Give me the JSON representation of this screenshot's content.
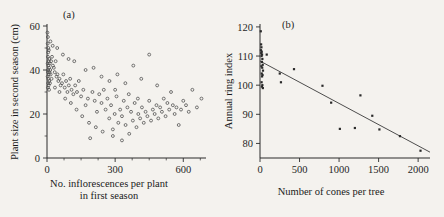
{
  "figure": {
    "background": "#f4f2ee",
    "ink": "#1f1f1f"
  },
  "chart_data": [
    {
      "type": "scatter",
      "panel_label": "(a)",
      "title": "",
      "xlabel_line1": "No. inflorescences per plant",
      "xlabel_line2": "in first season",
      "ylabel": "Plant size in second season (cm)",
      "xlim": [
        0,
        700
      ],
      "ylim": [
        0,
        60
      ],
      "xticks": [
        0,
        300,
        600
      ],
      "xticklabels": [
        "0",
        "300",
        "600"
      ],
      "xminorticks": [
        75,
        150,
        225,
        375,
        450,
        525,
        675
      ],
      "yticks": [
        0,
        20,
        40,
        60
      ],
      "yticklabels": [
        "0",
        "20",
        "40",
        "60"
      ],
      "yminorticks": [
        10,
        30,
        50
      ],
      "grid": false,
      "legend": "none",
      "marker": "open-circle",
      "points": [
        [
          2,
          57
        ],
        [
          4,
          55
        ],
        [
          3,
          52
        ],
        [
          6,
          50
        ],
        [
          5,
          48
        ],
        [
          8,
          49
        ],
        [
          4,
          46
        ],
        [
          10,
          45
        ],
        [
          7,
          44
        ],
        [
          3,
          43
        ],
        [
          12,
          43
        ],
        [
          6,
          42
        ],
        [
          9,
          41
        ],
        [
          5,
          40
        ],
        [
          14,
          40
        ],
        [
          4,
          39
        ],
        [
          11,
          39
        ],
        [
          8,
          38
        ],
        [
          3,
          37
        ],
        [
          16,
          38
        ],
        [
          6,
          36
        ],
        [
          10,
          35
        ],
        [
          5,
          34
        ],
        [
          13,
          34
        ],
        [
          7,
          33
        ],
        [
          4,
          32
        ],
        [
          9,
          31
        ],
        [
          18,
          44
        ],
        [
          22,
          46
        ],
        [
          26,
          42
        ],
        [
          30,
          41
        ],
        [
          34,
          39
        ],
        [
          38,
          44
        ],
        [
          42,
          37
        ],
        [
          46,
          38
        ],
        [
          50,
          35
        ],
        [
          55,
          36
        ],
        [
          60,
          33
        ],
        [
          66,
          34
        ],
        [
          72,
          38
        ],
        [
          78,
          32
        ],
        [
          84,
          35
        ],
        [
          90,
          30
        ],
        [
          96,
          33
        ],
        [
          102,
          36
        ],
        [
          108,
          31
        ],
        [
          116,
          29
        ],
        [
          124,
          33
        ],
        [
          132,
          30
        ],
        [
          140,
          35
        ],
        [
          150,
          28
        ],
        [
          160,
          31
        ],
        [
          170,
          24
        ],
        [
          180,
          27
        ],
        [
          190,
          9
        ],
        [
          200,
          30
        ],
        [
          210,
          26
        ],
        [
          220,
          21
        ],
        [
          230,
          29
        ],
        [
          240,
          25
        ],
        [
          250,
          31
        ],
        [
          258,
          22
        ],
        [
          266,
          27
        ],
        [
          274,
          18
        ],
        [
          282,
          24
        ],
        [
          290,
          13
        ],
        [
          298,
          20
        ],
        [
          306,
          28
        ],
        [
          314,
          16
        ],
        [
          322,
          22
        ],
        [
          330,
          19
        ],
        [
          338,
          26
        ],
        [
          346,
          15
        ],
        [
          354,
          23
        ],
        [
          362,
          11
        ],
        [
          370,
          21
        ],
        [
          378,
          17
        ],
        [
          386,
          25
        ],
        [
          394,
          14
        ],
        [
          402,
          20
        ],
        [
          410,
          18
        ],
        [
          418,
          23
        ],
        [
          426,
          16
        ],
        [
          434,
          21
        ],
        [
          442,
          19
        ],
        [
          450,
          26
        ],
        [
          458,
          17
        ],
        [
          466,
          22
        ],
        [
          474,
          20
        ],
        [
          482,
          24
        ],
        [
          490,
          18
        ],
        [
          498,
          23
        ],
        [
          506,
          21
        ],
        [
          514,
          27
        ],
        [
          522,
          19
        ],
        [
          530,
          25
        ],
        [
          538,
          22
        ],
        [
          546,
          30
        ],
        [
          554,
          24
        ],
        [
          562,
          20
        ],
        [
          570,
          23
        ],
        [
          580,
          15
        ],
        [
          590,
          22
        ],
        [
          600,
          26
        ],
        [
          612,
          24
        ],
        [
          624,
          21
        ],
        [
          640,
          31
        ],
        [
          660,
          23
        ],
        [
          680,
          27
        ],
        [
          170,
          40
        ],
        [
          205,
          41
        ],
        [
          240,
          37
        ],
        [
          275,
          35
        ],
        [
          310,
          38
        ],
        [
          345,
          34
        ],
        [
          380,
          42
        ],
        [
          415,
          36
        ],
        [
          450,
          47
        ],
        [
          485,
          33
        ],
        [
          120,
          44
        ],
        [
          95,
          45
        ],
        [
          70,
          47
        ],
        [
          45,
          50
        ],
        [
          25,
          51
        ],
        [
          15,
          53
        ],
        [
          20,
          36
        ],
        [
          35,
          32
        ],
        [
          55,
          30
        ],
        [
          80,
          27
        ],
        [
          105,
          25
        ],
        [
          130,
          22
        ],
        [
          155,
          19
        ],
        [
          185,
          16
        ],
        [
          215,
          14
        ],
        [
          245,
          12
        ],
        [
          290,
          10
        ],
        [
          330,
          8
        ],
        [
          300,
          31
        ],
        [
          360,
          29
        ],
        [
          400,
          27
        ]
      ]
    },
    {
      "type": "scatter",
      "panel_label": "(b)",
      "title": "",
      "xlabel": "Number of cones per tree",
      "ylabel": "Annual ring index",
      "xlim": [
        0,
        2150
      ],
      "ylim": [
        75,
        121
      ],
      "xticks": [
        0,
        500,
        1000,
        1500,
        2000
      ],
      "xticklabels": [
        "0",
        "500",
        "1000",
        "1500",
        "2000"
      ],
      "yticks": [
        80,
        90,
        100,
        110,
        120
      ],
      "yticklabels": [
        "80",
        "90",
        "100",
        "110",
        "120"
      ],
      "grid": false,
      "legend": "none",
      "marker": "filled-square",
      "points": [
        [
          10,
          118.5
        ],
        [
          14,
          114
        ],
        [
          18,
          113
        ],
        [
          12,
          112
        ],
        [
          22,
          111.5
        ],
        [
          16,
          111
        ],
        [
          26,
          110.5
        ],
        [
          20,
          110
        ],
        [
          30,
          109
        ],
        [
          24,
          108
        ],
        [
          34,
          107
        ],
        [
          18,
          106.5
        ],
        [
          28,
          106
        ],
        [
          38,
          105
        ],
        [
          22,
          104
        ],
        [
          32,
          103.5
        ],
        [
          26,
          103
        ],
        [
          20,
          101
        ],
        [
          30,
          100
        ],
        [
          24,
          99.5
        ],
        [
          36,
          99
        ],
        [
          85,
          110.5
        ],
        [
          250,
          104
        ],
        [
          265,
          101
        ],
        [
          430,
          105.5
        ],
        [
          790,
          99.8
        ],
        [
          900,
          94
        ],
        [
          1010,
          85
        ],
        [
          1200,
          85.3
        ],
        [
          1270,
          96.5
        ],
        [
          1420,
          89.5
        ],
        [
          1510,
          84.8
        ],
        [
          1770,
          82.5
        ],
        [
          2030,
          77.5
        ]
      ],
      "regression_line": {
        "x0": 0,
        "y0": 108.3,
        "x1": 2150,
        "y1": 77.0
      }
    }
  ]
}
